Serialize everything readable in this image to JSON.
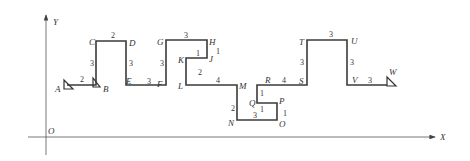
{
  "axes": {
    "y_label": "Y",
    "x_label": "X",
    "origin_label": "O"
  },
  "points": {
    "A": "A",
    "B": "B",
    "C": "C",
    "D": "D",
    "E": "E",
    "F": "F",
    "G": "G",
    "H": "H",
    "J": "J",
    "K": "K",
    "L": "L",
    "M": "M",
    "N": "N",
    "O": "O",
    "P": "P",
    "Q": "Q",
    "R": "R",
    "S": "S",
    "T": "T",
    "U": "U",
    "V": "V",
    "W": "W"
  },
  "segments": {
    "AB": "2",
    "BC": "3",
    "CD": "2",
    "DE": "3",
    "EF": "3",
    "FG": "3",
    "GH": "3",
    "HJ": "1",
    "JK": "1",
    "KL": "2",
    "LM": "4",
    "MN": "2",
    "NO": "3",
    "OP": "1",
    "PQ": "1",
    "QR": "1",
    "RS": "4",
    "ST": "3",
    "TU": "3",
    "UV": "3",
    "VW": "3"
  }
}
